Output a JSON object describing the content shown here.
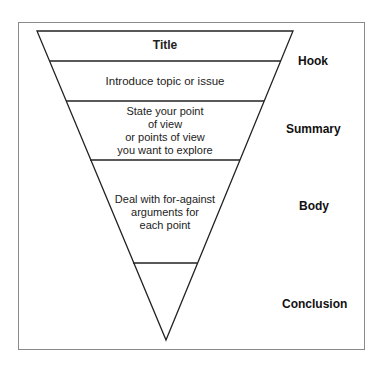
{
  "sections": [
    {
      "id": "title",
      "text": "Title"
    },
    {
      "id": "introduce",
      "text": "Introduce topic or issue"
    },
    {
      "id": "state",
      "lines": [
        "State your point",
        "of view",
        "or points of view",
        "you want to explore"
      ]
    },
    {
      "id": "deal",
      "lines": [
        "Deal with for-against",
        "arguments for",
        "each point"
      ]
    },
    {
      "id": "conclusion-segment",
      "text": ""
    }
  ],
  "side_labels": {
    "hook": "Hook",
    "summary": "Summary",
    "body": "Body",
    "conclusion": "Conclusion"
  },
  "colors": {
    "line": "#222222",
    "frame": "#8a8a8a",
    "background": "#ffffff"
  }
}
